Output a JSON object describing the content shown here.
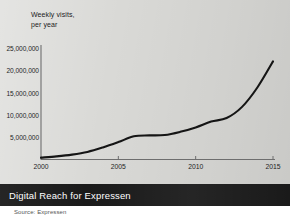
{
  "chart_data": {
    "type": "line",
    "title": "Digital Reach for Expressen",
    "subtitle": "",
    "axis_note": "Weekly visits,\nper year",
    "xlabel": "",
    "ylabel": "Weekly visits, per year",
    "source": "Source: Expressen",
    "grid": false,
    "legend": "none",
    "xlim": [
      2000,
      2015
    ],
    "ylim": [
      0,
      25000000
    ],
    "xticks": [
      2000,
      2005,
      2010,
      2015
    ],
    "xtick_labels": [
      "2000",
      "2005",
      "2010",
      "2015"
    ],
    "yticks": [
      5000000,
      10000000,
      15000000,
      20000000,
      25000000
    ],
    "ytick_labels": [
      "5,000,000",
      "10,000,000",
      "15,000,000",
      "20,000,000",
      "25,000,000"
    ],
    "line_color": "#151515",
    "x": [
      2000,
      2001,
      2002,
      2003,
      2004,
      2005,
      2006,
      2007,
      2008,
      2009,
      2010,
      2011,
      2012,
      2013,
      2014,
      2015
    ],
    "values": [
      400000,
      700000,
      1100000,
      1700000,
      2700000,
      3900000,
      5200000,
      5400000,
      5500000,
      6200000,
      7200000,
      8500000,
      9300000,
      11800000,
      16200000,
      22000000
    ],
    "series": [
      {
        "name": "Weekly visits, per year",
        "values": [
          400000,
          700000,
          1100000,
          1700000,
          2700000,
          3900000,
          5200000,
          5400000,
          5500000,
          6200000,
          7200000,
          8500000,
          9300000,
          11800000,
          16200000,
          22000000
        ]
      }
    ]
  },
  "colors": {
    "panel_background": "#d9d9d6",
    "caption_background": "#1a1a1a",
    "caption_text": "#ffffff",
    "axis": "#6e6e6e",
    "line": "#151515"
  }
}
